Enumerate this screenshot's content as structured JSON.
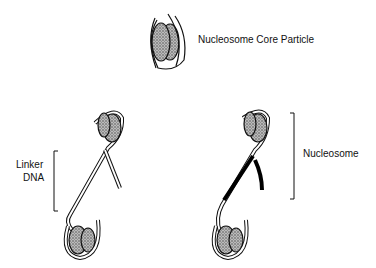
{
  "labels": {
    "core_particle": "Nucleosome Core Particle",
    "linker_line1": "Linker",
    "linker_line2": "DNA",
    "nucleosome": "Nucleosome"
  }
}
